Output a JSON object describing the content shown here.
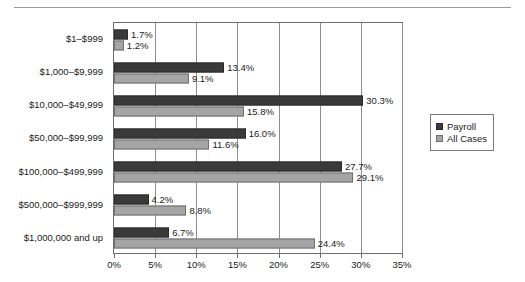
{
  "chart_data": {
    "type": "bar",
    "orientation": "horizontal",
    "title": "",
    "xlabel": "",
    "ylabel": "",
    "xlim": [
      0,
      35
    ],
    "xticks": [
      "0%",
      "5%",
      "10%",
      "15%",
      "20%",
      "25%",
      "30%",
      "35%"
    ],
    "xtick_values": [
      0,
      5,
      10,
      15,
      20,
      25,
      30,
      35
    ],
    "grid": true,
    "legend_position": "right",
    "categories": [
      "$1–$999",
      "$1,000–$9,999",
      "$10,000–$49,999",
      "$50,000–$99,999",
      "$100,000–$499,999",
      "$500,000–$999,999",
      "$1,000,000 and up"
    ],
    "series": [
      {
        "name": "Payroll",
        "color": "#3a3a3a",
        "values": [
          1.7,
          13.4,
          30.3,
          16.0,
          27.7,
          4.2,
          6.7
        ],
        "labels": [
          "1.7%",
          "13.4%",
          "30.3%",
          "16.0%",
          "27.7%",
          "4.2%",
          "6.7%"
        ]
      },
      {
        "name": "All Cases",
        "color": "#a5a5a5",
        "values": [
          1.2,
          9.1,
          15.8,
          11.6,
          29.1,
          8.8,
          24.4
        ],
        "labels": [
          "1.2%",
          "9.1%",
          "15.8%",
          "11.6%",
          "29.1%",
          "8.8%",
          "24.4%"
        ]
      }
    ]
  },
  "legend": {
    "items": [
      {
        "label": "Payroll",
        "swatch": "payroll"
      },
      {
        "label": "All Cases",
        "swatch": "allcases"
      }
    ]
  }
}
